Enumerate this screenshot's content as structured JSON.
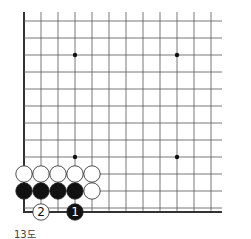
{
  "diagram": {
    "type": "go-board-corner",
    "caption": "13도",
    "grid": {
      "columns": 12,
      "rows": 12,
      "origin_x": 24,
      "origin_y": 21,
      "spacing": 17
    },
    "edges": [
      "left",
      "bottom"
    ],
    "star_points": [
      [
        3,
        2
      ],
      [
        9,
        2
      ],
      [
        3,
        8
      ],
      [
        9,
        8
      ]
    ],
    "stones": [
      {
        "color": "white",
        "col": 0,
        "row": 9
      },
      {
        "color": "white",
        "col": 1,
        "row": 9
      },
      {
        "color": "white",
        "col": 2,
        "row": 9
      },
      {
        "color": "white",
        "col": 3,
        "row": 9
      },
      {
        "color": "white",
        "col": 4,
        "row": 9
      },
      {
        "color": "black",
        "col": 0,
        "row": 10
      },
      {
        "color": "black",
        "col": 1,
        "row": 10
      },
      {
        "color": "black",
        "col": 2,
        "row": 10
      },
      {
        "color": "black",
        "col": 3,
        "row": 10
      },
      {
        "color": "white",
        "col": 4,
        "row": 10
      },
      {
        "color": "white",
        "col": 1,
        "row": 11,
        "label": "2"
      },
      {
        "color": "black",
        "col": 3,
        "row": 11,
        "label": "1"
      }
    ],
    "colors": {
      "line": "#555555",
      "edge": "#333333",
      "black": "#111111",
      "white": "#ffffff"
    }
  }
}
